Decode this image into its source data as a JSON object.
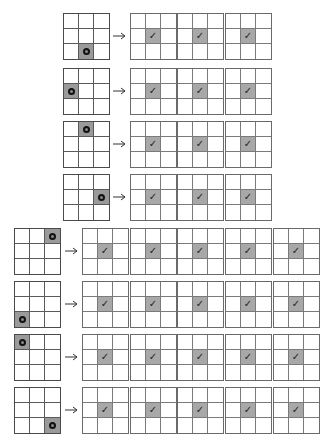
{
  "diagram": {
    "grid_size": 3,
    "colors": {
      "filled": "#9a9a9a",
      "border": "#4a4a4a",
      "background": "#ffffff"
    },
    "symbols": {
      "marker": "circle-marker",
      "check": "✓",
      "arrow": "→"
    },
    "rows": [
      {
        "source_marked_cell": [
          2,
          1
        ],
        "output_count": 3,
        "output_checked_cell": [
          1,
          1
        ]
      },
      {
        "source_marked_cell": [
          1,
          0
        ],
        "output_count": 3,
        "output_checked_cell": [
          1,
          1
        ]
      },
      {
        "source_marked_cell": [
          0,
          1
        ],
        "output_count": 3,
        "output_checked_cell": [
          1,
          1
        ]
      },
      {
        "source_marked_cell": [
          1,
          2
        ],
        "output_count": 3,
        "output_checked_cell": [
          1,
          1
        ]
      },
      {
        "source_marked_cell": [
          0,
          2
        ],
        "output_count": 5,
        "output_checked_cell": [
          1,
          1
        ]
      },
      {
        "source_marked_cell": [
          2,
          0
        ],
        "output_count": 5,
        "output_checked_cell": [
          1,
          1
        ]
      },
      {
        "source_marked_cell": [
          0,
          0
        ],
        "output_count": 5,
        "output_checked_cell": [
          1,
          1
        ]
      },
      {
        "source_marked_cell": [
          2,
          2
        ],
        "output_count": 5,
        "output_checked_cell": [
          1,
          1
        ]
      }
    ]
  }
}
